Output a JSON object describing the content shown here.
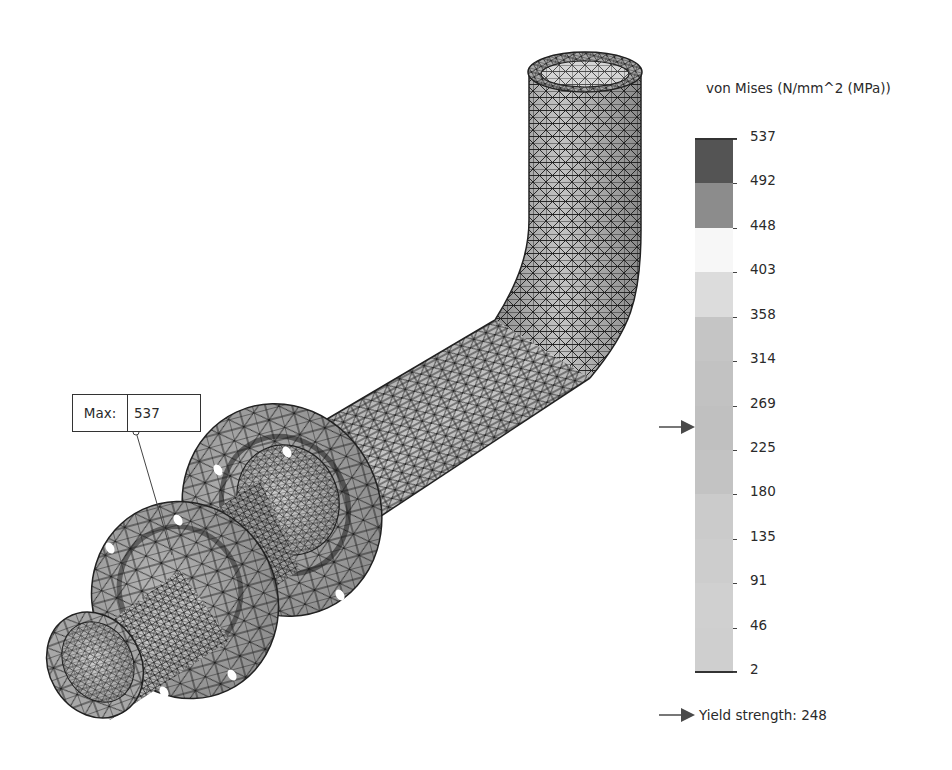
{
  "plot": {
    "type": "FEA stress plot",
    "result_quantity": "von Mises",
    "model_description": "meshed bent pipe with two bolted flanges",
    "max_probe": {
      "label": "Max:",
      "value": "537"
    }
  },
  "legend": {
    "title": "von Mises (N/mm^2 (MPa))",
    "ticks": [
      "537",
      "492",
      "448",
      "403",
      "358",
      "314",
      "269",
      "225",
      "180",
      "135",
      "91",
      "46",
      "2"
    ],
    "band_colors": [
      "#545454",
      "#8c8c8c",
      "#f7f7f7",
      "#dcdcdc",
      "#c5c5c5",
      "#c2c2c2",
      "#c0c0c0",
      "#c3c3c3",
      "#cbcbcb",
      "#cdcdcd",
      "#d0d0d0",
      "#cfcfcf",
      "#c4c4c4"
    ],
    "yield_marker_value": 248,
    "yield_label": "Yield strength: 248",
    "marker_color": "#4a4a4a"
  },
  "colors": {
    "mesh_line": "#1a1a1a",
    "surface_light": "#bdbdbd",
    "surface_mid": "#9a9a9a",
    "surface_dark": "#6e6e6e"
  },
  "chart_data": {
    "type": "heatmap",
    "title": "von Mises (N/mm^2 (MPa))",
    "colorbar": {
      "min": 2,
      "max": 537,
      "ticks": [
        537,
        492,
        448,
        403,
        358,
        314,
        269,
        225,
        180,
        135,
        91,
        46,
        2
      ],
      "num_bands": 12
    },
    "annotations": [
      {
        "text": "Max: 537",
        "type": "probe"
      },
      {
        "text": "Yield strength: 248",
        "type": "marker",
        "value": 248
      }
    ]
  }
}
